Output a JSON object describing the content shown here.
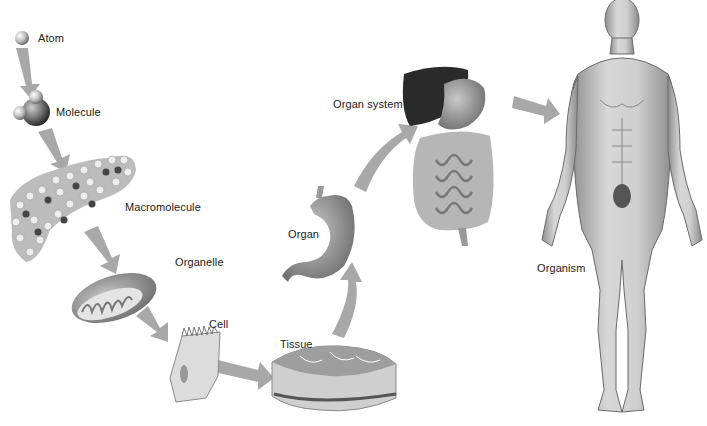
{
  "diagram": {
    "levels": [
      {
        "id": "atom",
        "label": "Atom"
      },
      {
        "id": "molecule",
        "label": "Molecule"
      },
      {
        "id": "macromolecule",
        "label": "Macromolecule"
      },
      {
        "id": "organelle",
        "label": "Organelle"
      },
      {
        "id": "cell",
        "label": "Cell"
      },
      {
        "id": "tissue",
        "label": "Tissue"
      },
      {
        "id": "organ",
        "label": "Organ"
      },
      {
        "id": "organ_system",
        "label": "Organ system"
      },
      {
        "id": "organism",
        "label": "Organism"
      }
    ],
    "arrow_color": "#a8a8a8"
  }
}
